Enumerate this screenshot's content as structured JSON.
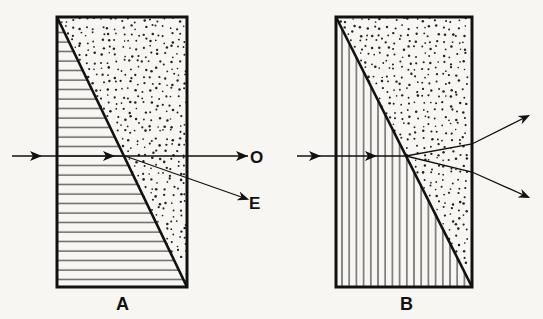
{
  "figure": {
    "panels": [
      {
        "id": "A",
        "label": "A",
        "hatch": "horizontal",
        "description": "Birefringent prism: ray splits into ordinary (O) undeviated and extraordinary (E) deviated downward",
        "rays": [
          {
            "name": "ordinary",
            "label": "O"
          },
          {
            "name": "extraordinary",
            "label": "E"
          }
        ]
      },
      {
        "id": "B",
        "label": "B",
        "hatch": "vertical",
        "description": "Prism with vertical optic axis: ray splits into two beams diverging up and down",
        "rays": [
          {
            "name": "upper-beam",
            "label": ""
          },
          {
            "name": "lower-beam",
            "label": ""
          }
        ]
      }
    ],
    "colors": {
      "ink": "#111111",
      "paper": "#f7f6f2"
    }
  }
}
